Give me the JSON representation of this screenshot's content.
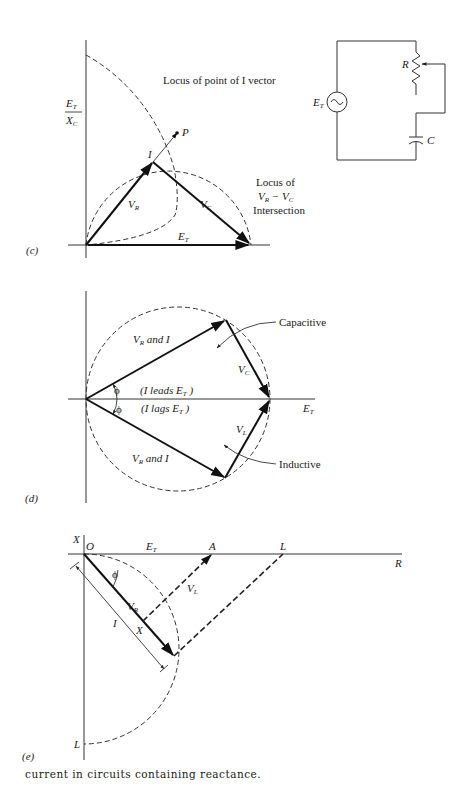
{
  "panel_c": {
    "tag": "(c)",
    "y_axis_label_num": "E",
    "y_axis_label_num_sub": "T",
    "y_axis_label_den": "X",
    "y_axis_label_den_sub": "C",
    "locus_I_label": "Locus of point of I vector",
    "point_P": "P",
    "point_I": "I",
    "vr_label": "V",
    "vr_sub": "R",
    "vc_label": "V",
    "vc_sub": "C",
    "et_label": "E",
    "et_sub": "T",
    "locus_int_line1": "Locus of",
    "locus_int_line2_a": "V",
    "locus_int_line2_a_sub": "R",
    "locus_int_line2_b": " − V",
    "locus_int_line2_b_sub": "C",
    "locus_int_line3": "Intersection"
  },
  "circuit": {
    "source_label": "E",
    "source_sub": "T",
    "resistor_label": "R",
    "capacitor_label": "C",
    "source_symbol": "~"
  },
  "panel_d": {
    "tag": "(d)",
    "upper_vec_label": "V",
    "upper_vec_sub": "R",
    "upper_vec_suffix": " and I",
    "lower_vec_label": "V",
    "lower_vec_sub": "R",
    "lower_vec_suffix": " and I",
    "phi_upper": "ϕ",
    "phi_lower": "ϕ",
    "leads_text": "(I leads E",
    "leads_sub": "T",
    "leads_close": " )",
    "lags_text": "(I lags E",
    "lags_sub": "T",
    "lags_close": " )",
    "vc_label": "V",
    "vc_sub": "C",
    "vl_label": "V",
    "vl_sub": "L",
    "et_label": "E",
    "et_sub": "T",
    "capacitive": "Capacitive",
    "inductive": "Inductive"
  },
  "panel_e": {
    "tag": "(e)",
    "axis_x": "X",
    "origin": "O",
    "et_label": "E",
    "et_sub": "T",
    "point_A": "A",
    "point_L_top": "L",
    "axis_R": "R",
    "phi": "ϕ",
    "vr_label": "V",
    "vr_sub": "R",
    "vl_label": "V",
    "vl_sub": "L",
    "I_label": "I",
    "point_X": "X",
    "point_L_bottom": "L"
  },
  "caption": "current in circuits containing reactance."
}
